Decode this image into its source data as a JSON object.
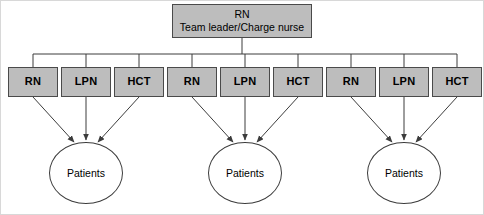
{
  "diagram": {
    "title_node": {
      "line_1": "RN",
      "line_2": "Team leader/Charge nurse"
    },
    "colors": {
      "box_fill": "#bdbdbd",
      "box_border": "#4a4a4a",
      "line": "#3c3c3c",
      "frame": "#d8d8d8",
      "background": "#ffffff",
      "text": "#000000"
    },
    "groups": [
      {
        "roles": [
          {
            "label": "RN"
          },
          {
            "label": "LPN"
          },
          {
            "label": "HCT"
          }
        ],
        "target": {
          "label": "Patients"
        }
      },
      {
        "roles": [
          {
            "label": "RN"
          },
          {
            "label": "LPN"
          },
          {
            "label": "HCT"
          }
        ],
        "target": {
          "label": "Patients"
        }
      },
      {
        "roles": [
          {
            "label": "RN"
          },
          {
            "label": "LPN"
          },
          {
            "label": "HCT"
          }
        ],
        "target": {
          "label": "Patients"
        }
      }
    ]
  }
}
